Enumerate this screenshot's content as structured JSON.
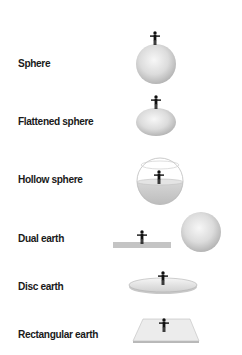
{
  "diagram": {
    "items": [
      {
        "label": "Sphere",
        "shape": "sphere-with-person-on-top"
      },
      {
        "label": "Flattened sphere",
        "shape": "oblate-ellipsoid-with-person-on-top"
      },
      {
        "label": "Hollow sphere",
        "shape": "hollow-sphere-with-person-inside"
      },
      {
        "label": "Dual earth",
        "shape": "flat-slab-with-person-and-separate-sphere"
      },
      {
        "label": "Disc earth",
        "shape": "flat-disc-with-person"
      },
      {
        "label": "Rectangular earth",
        "shape": "flat-rectangle-with-person"
      }
    ],
    "colors": {
      "shape_fill_light": "#f2f2f2",
      "shape_fill_dark": "#bdbdbd",
      "outline": "#9e9e9e",
      "person": "#111111",
      "label": "#1a1a1a"
    }
  }
}
